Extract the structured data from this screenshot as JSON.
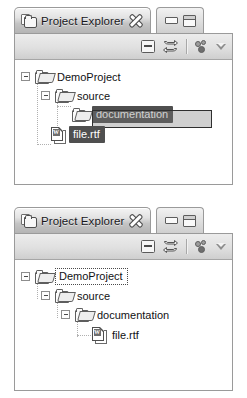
{
  "app": "Eclipse Project Explorer",
  "panels": [
    {
      "id": "before",
      "titlebar": {
        "icon": "project-explorer-icon",
        "title": "Project Explorer",
        "close_label": "Close",
        "minimize_label": "Minimize",
        "maximize_label": "Maximize"
      },
      "toolbar": {
        "collapse_all": "Collapse All",
        "link_with_editor": "Link with Editor",
        "view_menu": "View Menu",
        "chevron": "Show More"
      },
      "tree": [
        {
          "label": "DemoProject",
          "icon": "folder-icon",
          "depth": 0,
          "expanded": true,
          "selected": false,
          "focused": false
        },
        {
          "label": "source",
          "icon": "folder-icon",
          "depth": 1,
          "expanded": true,
          "selected": false,
          "focused": false
        },
        {
          "label": "documentation",
          "icon": "folder-icon",
          "depth": 2,
          "expanded": false,
          "selected": true,
          "focused": false,
          "drag_over": true
        },
        {
          "label": "file.rtf",
          "icon": "rtf-file-icon",
          "depth": 1,
          "expanded": false,
          "selected": true,
          "focused": false,
          "dragging": true
        }
      ],
      "cursor": {
        "name": "drag-move-cursor",
        "ghost": "drag-ghost"
      }
    },
    {
      "id": "after",
      "titlebar": {
        "icon": "project-explorer-icon",
        "title": "Project Explorer",
        "close_label": "Close",
        "minimize_label": "Minimize",
        "maximize_label": "Maximize"
      },
      "toolbar": {
        "collapse_all": "Collapse All",
        "link_with_editor": "Link with Editor",
        "view_menu": "View Menu",
        "chevron": "Show More"
      },
      "tree": [
        {
          "label": "DemoProject",
          "icon": "folder-icon",
          "depth": 0,
          "expanded": true,
          "selected": false,
          "focused": true
        },
        {
          "label": "source",
          "icon": "folder-icon",
          "depth": 1,
          "expanded": true,
          "selected": false,
          "focused": false
        },
        {
          "label": "documentation",
          "icon": "folder-icon",
          "depth": 2,
          "expanded": true,
          "selected": false,
          "focused": false
        },
        {
          "label": "file.rtf",
          "icon": "rtf-file-icon",
          "depth": 3,
          "expanded": false,
          "selected": false,
          "focused": false
        }
      ],
      "cursor": null
    }
  ],
  "colors": {
    "selection_bg": "#4f4f4f",
    "selection_fg": "#ffffff",
    "panel_border": "#9a9a9a",
    "toolbar_bg": "#e0e0e0",
    "tree_bg": "#ffffff",
    "text": "#111114",
    "guide": "#b0b0b0"
  },
  "doc_icon_letter": "W"
}
